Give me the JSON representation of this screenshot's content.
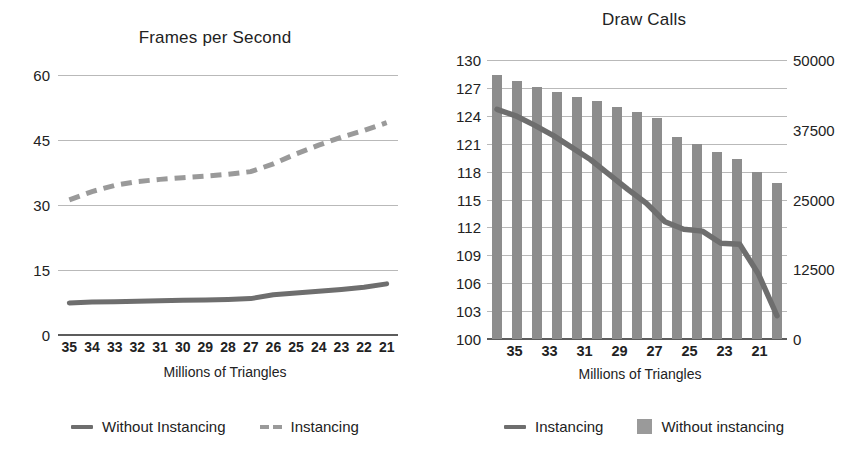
{
  "chart_data": [
    {
      "type": "line",
      "title": "Frames per Second",
      "xlabel": "Millions of Triangles",
      "ylabel": "",
      "ylim": [
        0,
        60
      ],
      "yticks": [
        0,
        15,
        30,
        45,
        60
      ],
      "grid": true,
      "legend_position": "bottom",
      "categories": [
        "35",
        "34",
        "33",
        "32",
        "31",
        "30",
        "29",
        "28",
        "27",
        "26",
        "25",
        "24",
        "23",
        "22",
        "21"
      ],
      "series": [
        {
          "name": "Without Instancing",
          "style": "solid",
          "color": "#6e6e6e",
          "values": [
            7.4,
            7.6,
            7.7,
            7.8,
            7.9,
            8.0,
            8.1,
            8.2,
            8.4,
            9.3,
            9.7,
            10.1,
            10.5,
            11.0,
            11.8
          ]
        },
        {
          "name": "Instancing",
          "style": "dashed",
          "color": "#9a9a9a",
          "values": [
            31.2,
            33.0,
            34.4,
            35.3,
            35.8,
            36.2,
            36.5,
            36.9,
            37.3,
            38.0,
            40.3,
            42.4,
            44.2,
            45.9,
            47.3,
            49.0
          ]
        }
      ]
    },
    {
      "type": "bar",
      "title": "Draw Calls",
      "xlabel": "Millions of Triangles",
      "grid": true,
      "legend_position": "bottom",
      "categories": [
        "35",
        "34",
        "33",
        "32",
        "31",
        "30",
        "29",
        "28",
        "27",
        "26",
        "25",
        "24",
        "23",
        "22",
        "21"
      ],
      "xtick_labels": [
        "35",
        "33",
        "31",
        "29",
        "27",
        "25",
        "23",
        "21"
      ],
      "left_axis": {
        "name": "Instancing",
        "ylim": [
          100,
          130
        ],
        "yticks": [
          100,
          103,
          106,
          109,
          112,
          115,
          118,
          121,
          124,
          127,
          130
        ]
      },
      "right_axis": {
        "name": "Without instancing",
        "ylim": [
          0,
          50000
        ],
        "yticks": [
          0,
          12500,
          25000,
          37500,
          50000
        ]
      },
      "series": [
        {
          "name": "Instancing",
          "style": "solid",
          "color": "#6e6e6e",
          "axis": "left",
          "values": [
            124.7,
            124.0,
            123.0,
            121.9,
            120.6,
            119.3,
            117.7,
            116.1,
            114.6,
            112.6,
            111.8,
            111.6,
            110.3,
            110.2,
            107.0,
            102.5
          ]
        },
        {
          "name": "Without instancing",
          "style": "bar",
          "color": "#8d8d8d",
          "axis": "right",
          "values": [
            47400,
            46300,
            45100,
            44200,
            43400,
            42600,
            41500,
            40600,
            39600,
            36200,
            34900,
            33500,
            32200,
            30000,
            28000
          ]
        }
      ]
    }
  ],
  "left_chart": {
    "title": "Frames per Second",
    "xlabel": "Millions of Triangles",
    "yticks": [
      "60",
      "45",
      "30",
      "15",
      "0"
    ],
    "xticks": [
      "35",
      "34",
      "33",
      "32",
      "31",
      "30",
      "29",
      "28",
      "27",
      "26",
      "25",
      "24",
      "23",
      "22",
      "21"
    ],
    "legend": [
      {
        "label": "Without Instancing",
        "swatch": "line-solid-icon"
      },
      {
        "label": "Instancing",
        "swatch": "line-dashed-icon"
      }
    ]
  },
  "right_chart": {
    "title": "Draw Calls",
    "xlabel": "Millions of Triangles",
    "yticks_left": [
      "130",
      "127",
      "124",
      "121",
      "118",
      "115",
      "112",
      "109",
      "106",
      "103",
      "100"
    ],
    "yticks_right": [
      "50000",
      "37500",
      "25000",
      "12500",
      "0"
    ],
    "xticks": [
      "35",
      "33",
      "31",
      "29",
      "27",
      "25",
      "23",
      "21"
    ],
    "legend": [
      {
        "label": "Instancing",
        "swatch": "line-solid-icon"
      },
      {
        "label": "Without instancing",
        "swatch": "square-icon"
      }
    ]
  },
  "colors": {
    "line_solid": "#6e6e6e",
    "line_dashed": "#9a9a9a",
    "bar": "#8d8d8d",
    "grid": "#b9b9b9",
    "axis": "#5c5c5c",
    "text": "#222222",
    "background": "#ffffff"
  }
}
